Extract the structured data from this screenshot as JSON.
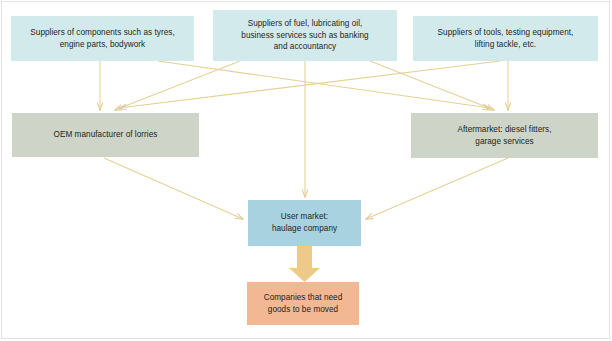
{
  "diagram": {
    "type": "flow-diagram",
    "colors": {
      "supplier_box": "#d3eaec",
      "maker_box": "#ced4c8",
      "user_box": "#a9d2e0",
      "demand_box": "#f2b894",
      "arrow": "#e8d79a",
      "thick_arrow": "#efc97e",
      "text": "#231f20",
      "frame": "#e2e4e3",
      "background": "#ffffff"
    },
    "nodes": [
      {
        "id": "components",
        "role": "supplier",
        "lines": [
          "Suppliers of components such as tyres,",
          "engine parts, bodywork"
        ]
      },
      {
        "id": "fuel",
        "role": "supplier",
        "lines": [
          "Suppliers of fuel, lubricating oil,",
          "business services such as banking",
          "and accountancy"
        ]
      },
      {
        "id": "tools",
        "role": "supplier",
        "lines": [
          "Suppliers of tools, testing equipment,",
          "lifting tackle, etc."
        ]
      },
      {
        "id": "oem",
        "role": "manufacturer",
        "lines": [
          "OEM manufacturer of lorries"
        ]
      },
      {
        "id": "aftermarket",
        "role": "manufacturer",
        "lines": [
          "Aftermarket: diesel fitters,",
          "garage services"
        ]
      },
      {
        "id": "usermarket",
        "role": "user",
        "lines": [
          "User market:",
          "haulage company"
        ]
      },
      {
        "id": "companies",
        "role": "demand",
        "lines": [
          "Companies that need",
          "goods to be moved"
        ]
      }
    ],
    "edges": [
      {
        "from": "components",
        "to": "oem",
        "style": "thin"
      },
      {
        "from": "fuel",
        "to": "oem",
        "style": "thin"
      },
      {
        "from": "tools",
        "to": "oem",
        "style": "thin"
      },
      {
        "from": "components",
        "to": "aftermarket",
        "style": "thin"
      },
      {
        "from": "fuel",
        "to": "aftermarket",
        "style": "thin"
      },
      {
        "from": "tools",
        "to": "aftermarket",
        "style": "thin"
      },
      {
        "from": "oem",
        "to": "usermarket",
        "style": "thin"
      },
      {
        "from": "fuel",
        "to": "usermarket",
        "style": "thin"
      },
      {
        "from": "aftermarket",
        "to": "usermarket",
        "style": "thin"
      },
      {
        "from": "usermarket",
        "to": "companies",
        "style": "block"
      }
    ]
  }
}
